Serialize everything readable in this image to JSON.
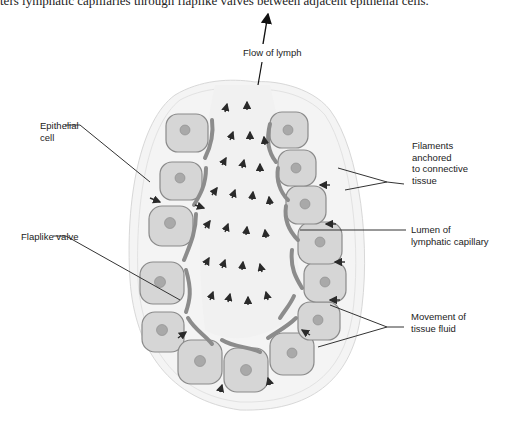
{
  "caption": "ters lymphatic capillaries through flaplike valves between adjacent epithelial cells.",
  "figure": {
    "labels": {
      "flow_of_lymph": "Flow of lymph",
      "epithelial_cell_1": "Epithelial",
      "epithelial_cell_2": "cell",
      "filaments_1": "Filaments",
      "filaments_2": "anchored",
      "filaments_3": "to connective",
      "filaments_4": "tissue",
      "flaplike_valve": "Flaplike valve",
      "lumen_1": "Lumen of",
      "lumen_2": "lymphatic capillary",
      "movement_1": "Movement of",
      "movement_2": "tissue fluid"
    },
    "colors": {
      "cell_fill": "#d6d6d6",
      "cell_outline": "#8a8a8a",
      "nucleus": "#a9a9a9",
      "valve": "#8c8c8c",
      "arrow": "#2a2a2a",
      "leader_line": "#333333",
      "lumen": "#f3f3f3"
    }
  }
}
